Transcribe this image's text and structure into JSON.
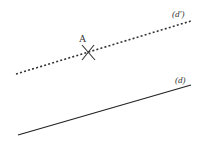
{
  "diagram": {
    "point": {
      "label": "A",
      "x": 88,
      "y": 52
    },
    "line_dashed": {
      "label": "(d')",
      "x1": 16,
      "y1": 74,
      "x2": 191,
      "y2": 21,
      "style": "dotted"
    },
    "line_solid": {
      "label": "(d)",
      "x1": 18,
      "y1": 135,
      "x2": 191,
      "y2": 85,
      "style": "solid"
    },
    "colors": {
      "stroke": "#333333",
      "background": "#ffffff"
    }
  }
}
